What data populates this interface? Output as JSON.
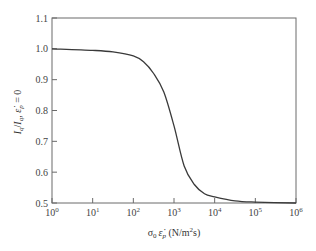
{
  "chart_data": {
    "type": "line",
    "title": "",
    "xlabel": "σ0 ε̇p (N/m²s)",
    "xlabel_parts": {
      "sigma": "σ",
      "sigma_sub": "0",
      "eps": "ε̇",
      "eps_sub": "p",
      "units_pre": " (N/m",
      "units_sup": "2",
      "units_post": "s)"
    },
    "ylabel": "Iq/Iq, ε̇p = 0",
    "ylabel_parts": {
      "i1": "I",
      "s1": "q",
      "slash": "/",
      "i2": "I",
      "s2": "q",
      "comma": ", ",
      "eps": "ε̇",
      "es": "p",
      "eq": " = 0"
    },
    "xscale": "log",
    "xlim": [
      1,
      1000000
    ],
    "ylim": [
      0.5,
      1.1
    ],
    "grid": false,
    "legend": null,
    "x_ticks": [
      {
        "exp": "0",
        "value": 1
      },
      {
        "exp": "1",
        "value": 10
      },
      {
        "exp": "2",
        "value": 100
      },
      {
        "exp": "3",
        "value": 1000
      },
      {
        "exp": "4",
        "value": 10000
      },
      {
        "exp": "5",
        "value": 100000
      },
      {
        "exp": "6",
        "value": 1000000
      }
    ],
    "y_ticks": [
      "0.5",
      "0.6",
      "0.7",
      "0.8",
      "0.9",
      "1.0",
      "1.1"
    ],
    "series": [
      {
        "name": "normalized current",
        "color": "#3a3a3a",
        "x": [
          1,
          10,
          31.6,
          100,
          178,
          316,
          562,
          1000,
          1778,
          3162,
          5623,
          10000,
          31623,
          100000,
          1000000
        ],
        "values": [
          1.0,
          0.995,
          0.99,
          0.977,
          0.958,
          0.92,
          0.86,
          0.75,
          0.62,
          0.56,
          0.53,
          0.52,
          0.507,
          0.503,
          0.5
        ]
      }
    ]
  }
}
